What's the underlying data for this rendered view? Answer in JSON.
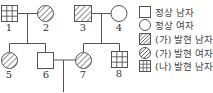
{
  "pedigree": {
    "individuals": [
      {
        "id": "1",
        "label": "1",
        "sex": "male",
        "phenotype": "(나) 발현"
      },
      {
        "id": "2",
        "label": "2",
        "sex": "female",
        "phenotype": "(가) 발현"
      },
      {
        "id": "3",
        "label": "3",
        "sex": "male",
        "phenotype": "(가) 발현"
      },
      {
        "id": "4",
        "label": "4",
        "sex": "female",
        "phenotype": "정상"
      },
      {
        "id": "5",
        "label": "5",
        "sex": "female",
        "phenotype": "(가) 발현"
      },
      {
        "id": "6",
        "label": "6",
        "sex": "male",
        "phenotype": "정상"
      },
      {
        "id": "7",
        "label": "7",
        "sex": "female",
        "phenotype": "(가) 발현"
      },
      {
        "id": "8",
        "label": "8",
        "sex": "male",
        "phenotype": "(나) 발현"
      }
    ]
  },
  "legend": {
    "items": [
      {
        "icon": "normal-male-icon",
        "label": "정상 남자"
      },
      {
        "icon": "normal-female-icon",
        "label": "정상 여자"
      },
      {
        "icon": "trait-a-male-icon",
        "label": "(가) 발현 남자"
      },
      {
        "icon": "trait-a-female-icon",
        "label": "(가) 발현 여자"
      },
      {
        "icon": "trait-b-male-icon",
        "label": "(나) 발현 남자"
      }
    ]
  }
}
